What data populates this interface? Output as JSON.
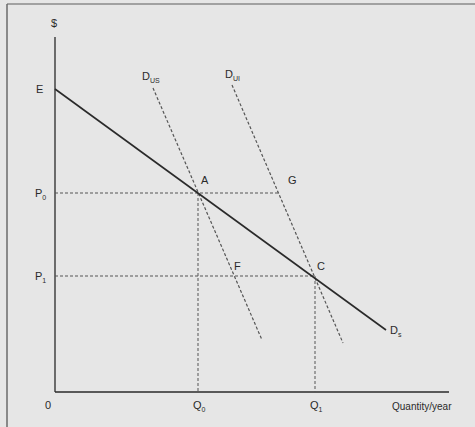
{
  "diagram": {
    "type": "demand-curve-diagram",
    "y_axis_label": "$",
    "x_axis_label": "Quantity/year",
    "origin_label": "0",
    "price_labels": [
      {
        "main": "E",
        "sub": ""
      },
      {
        "main": "P",
        "sub": "0"
      },
      {
        "main": "P",
        "sub": "1"
      }
    ],
    "quantity_labels": [
      {
        "main": "Q",
        "sub": "0"
      },
      {
        "main": "Q",
        "sub": "1"
      }
    ],
    "curves": [
      {
        "main": "D",
        "sub": "s",
        "style": "solid",
        "description": "Demand curve from E sloping down"
      },
      {
        "main": "D",
        "sub": "US",
        "style": "dashed"
      },
      {
        "main": "D",
        "sub": "UI",
        "style": "dashed"
      }
    ],
    "points": [
      "A",
      "G",
      "F",
      "C"
    ],
    "colors": {
      "background": "#e6e6e6",
      "line": "#2a2a2a",
      "dashed": "#555555",
      "frame": "#6a6a6a"
    }
  }
}
